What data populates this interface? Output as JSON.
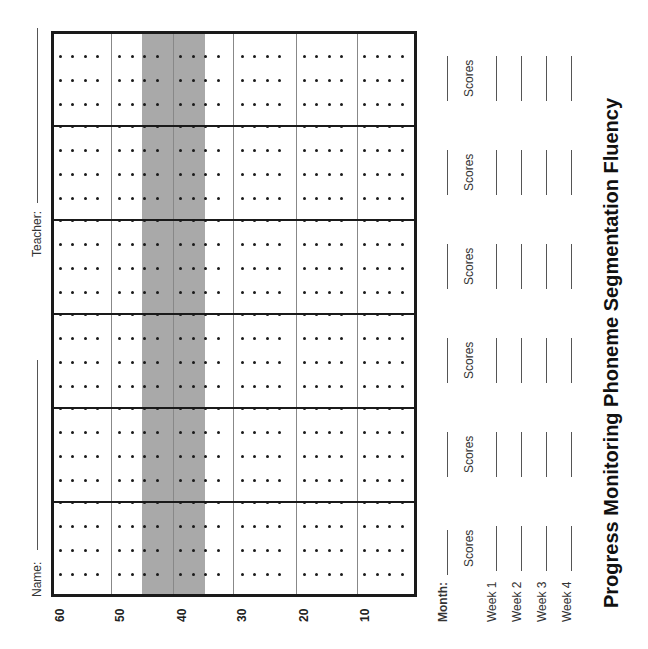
{
  "title": "Progress Monitoring Phoneme Segmentation Fluency",
  "header": {
    "name_label": "Name:",
    "teacher_label": "Teacher:"
  },
  "chart_data": {
    "type": "table",
    "title": "Progress Monitoring Phoneme Segmentation Fluency",
    "axis_ticks": [
      "60",
      "50",
      "40",
      "30",
      "20",
      "10"
    ],
    "shaded_range": [
      35,
      45
    ],
    "weeks_per_month": 4,
    "months": 6,
    "orientation": "rotated-90-ccw"
  },
  "axis": {
    "ticks": [
      "60",
      "50",
      "40",
      "30",
      "20",
      "10"
    ]
  },
  "months_block": {
    "month_label": "Month:",
    "scores_label": "Scores",
    "weeks": [
      "Week 1",
      "Week 2",
      "Week 3",
      "Week 4"
    ],
    "columns": [
      "Scores",
      "Scores",
      "Scores",
      "Scores",
      "Scores",
      "Scores"
    ]
  },
  "colors": {
    "shade": "#a9a9a9",
    "border": "#1a1a1a"
  }
}
